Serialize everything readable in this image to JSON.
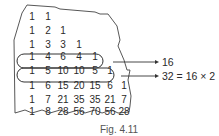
{
  "figure": {
    "caption": "Fig. 4.11",
    "rows": [
      [
        "1",
        "1"
      ],
      [
        "1",
        "2",
        "1"
      ],
      [
        "1",
        "3",
        "3",
        "1"
      ],
      [
        "1",
        "4",
        "6",
        "4",
        "1"
      ],
      [
        "1",
        "5",
        "10",
        "10",
        "5",
        "1"
      ],
      [
        "1",
        "6",
        "15",
        "20",
        "15",
        "6",
        "1"
      ],
      [
        "1",
        "7",
        "21",
        "35",
        "35",
        "21",
        "7"
      ],
      [
        "1",
        "8",
        "28",
        "56",
        "70",
        "56",
        "28"
      ]
    ],
    "annotations": [
      {
        "row": 3,
        "text": "16"
      },
      {
        "row": 4,
        "text": "32 = 16 × 2"
      }
    ]
  }
}
